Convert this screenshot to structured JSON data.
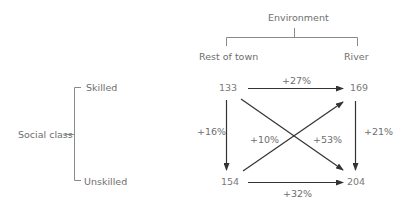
{
  "environment": {
    "title": "Environment",
    "columns": [
      "Rest of town",
      "River"
    ]
  },
  "social_class": {
    "title": "Social class",
    "rows": [
      "Skilled",
      "Unskilled"
    ]
  },
  "values": {
    "skilled_rest_of_town": "133",
    "skilled_river": "169",
    "unskilled_rest_of_town": "154",
    "unskilled_river": "204"
  },
  "changes": {
    "top_horizontal": "+27%",
    "bottom_horizontal": "+32%",
    "left_vertical": "+16%",
    "right_vertical": "+21%",
    "diagonal_up": "+10%",
    "diagonal_down": "+53%"
  },
  "colors": {
    "line": "#8a8a8a",
    "arrow": "#333333",
    "text": "#6e6e6e"
  }
}
